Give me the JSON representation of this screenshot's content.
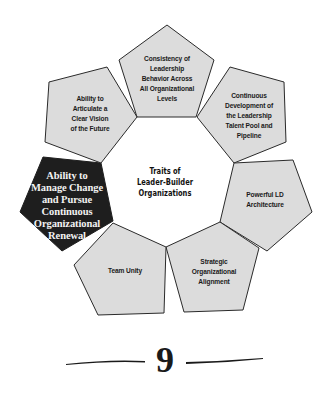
{
  "diagram": {
    "center_title": [
      "Traits of",
      "Leader-Builder",
      "Organizations"
    ],
    "traits": [
      {
        "id": "consistency",
        "lines": [
          "Consistency of",
          "Leadership",
          "Behavior Across",
          "All Organizational",
          "Levels"
        ],
        "highlighted": false
      },
      {
        "id": "continuous-development",
        "lines": [
          "Continuous",
          "Development of",
          "the Leadership",
          "Talent Pool and",
          "Pipeline"
        ],
        "highlighted": false
      },
      {
        "id": "powerful-ld",
        "lines": [
          "Powerful LD",
          "Architecture"
        ],
        "highlighted": false
      },
      {
        "id": "strategic-alignment",
        "lines": [
          "Strategic",
          "Organizational",
          "Alignment"
        ],
        "highlighted": false
      },
      {
        "id": "team-unity",
        "lines": [
          "Team Unity"
        ],
        "highlighted": false
      },
      {
        "id": "manage-change",
        "lines": [
          "Ability to",
          "Manage Change",
          "and Pursue",
          "Continuous",
          "Organizational",
          "Renewal"
        ],
        "highlighted": true
      },
      {
        "id": "articulate-vision",
        "lines": [
          "Ability to",
          "Articulate a",
          "Clear Vision",
          "of the Future"
        ],
        "highlighted": false
      }
    ],
    "colors": {
      "pentagon_fill": "#dcdcdc",
      "pentagon_stroke": "#2a2a2a",
      "highlight_fill": "#1e1e1e",
      "highlight_text": "#f2f2f2"
    }
  },
  "footer": {
    "page_number": "9"
  }
}
